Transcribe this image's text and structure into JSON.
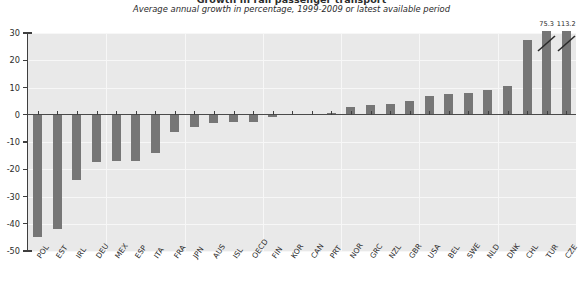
{
  "chart": {
    "title": "Growth in rail passenger transport",
    "subtitle": "Average annual growth in percentage, 1999-2009 or latest available period"
  },
  "axes": {
    "y_ticks": [
      "30",
      "20",
      "10",
      "0",
      "-10",
      "-20",
      "-30",
      "-40",
      "-50"
    ],
    "y_min": -50,
    "y_max": 30,
    "x_axis_label": "",
    "y_axis_label": ""
  },
  "chart_data": {
    "type": "bar",
    "title": "Growth in rail passenger transport",
    "subtitle": "Average annual growth in percentage, 1999-2009 or latest available period",
    "xlabel": "",
    "ylabel": "",
    "ylim": [
      -50,
      30
    ],
    "grid": true,
    "legend": "none",
    "orientation": "vertical",
    "bar_color": "#767676",
    "plot_background": "#e9e9e9",
    "gridline_color": "#f7f7f7",
    "categories": [
      "POL",
      "EST",
      "IRL",
      "DEU",
      "MEX",
      "ESP",
      "ITA",
      "FRA",
      "JPN",
      "AUS",
      "ISL",
      "OECD",
      "FIN",
      "KOR",
      "CAN",
      "PRT",
      "NOR",
      "GRC",
      "NZL",
      "GBR",
      "USA",
      "BEL",
      "SWE",
      "NLD",
      "DNK",
      "CHL",
      "TUR",
      "CZE"
    ],
    "values": [
      -45.0,
      -42.0,
      -24.0,
      -17.5,
      -17.0,
      -17.0,
      -14.0,
      -6.5,
      -4.5,
      -3.0,
      -2.5,
      -2.5,
      -1.0,
      0.2,
      0.3,
      0.5,
      3.0,
      3.5,
      4.0,
      5.0,
      7.0,
      7.5,
      8.0,
      9.0,
      10.5,
      27.5,
      75.3,
      113.2
    ],
    "clipped_bars": [
      {
        "category": "TUR",
        "value": 75.3,
        "label": "75.3"
      },
      {
        "category": "CZE",
        "value": 113.2,
        "label": "113.2"
      }
    ]
  }
}
